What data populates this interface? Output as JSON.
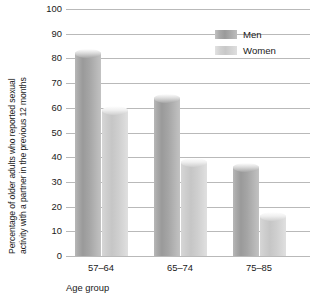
{
  "chart_data": {
    "type": "bar",
    "title": "",
    "subtitle": "",
    "categories": [
      "57–64",
      "65–74",
      "75–85"
    ],
    "series": [
      {
        "name": "Men",
        "values": [
          82,
          64,
          36
        ],
        "color": "#a5a5a5"
      },
      {
        "name": "Women",
        "values": [
          59,
          38,
          16
        ],
        "color": "#d2d2d2"
      }
    ],
    "xlabel": "Age group",
    "ylabel": "Percentage of older adults who reported sexual activity with a partner in the previous 12 months",
    "ylim": [
      0,
      100
    ],
    "ytick_step": 10,
    "yticks": [
      "100",
      "90",
      "80",
      "70",
      "60",
      "50",
      "40",
      "30",
      "20",
      "10",
      "0"
    ],
    "grid": true,
    "legend_position": "top-right"
  },
  "axis": {
    "ylabel_line1": "Percentage of older adults who reported sexual",
    "ylabel_line2": "activity with a partner in the previous 12 months",
    "xlabel": "Age group"
  },
  "legend": {
    "items": [
      {
        "label": "Men",
        "swatch": "legend-swatch-men"
      },
      {
        "label": "Women",
        "swatch": "legend-swatch-women"
      }
    ]
  }
}
